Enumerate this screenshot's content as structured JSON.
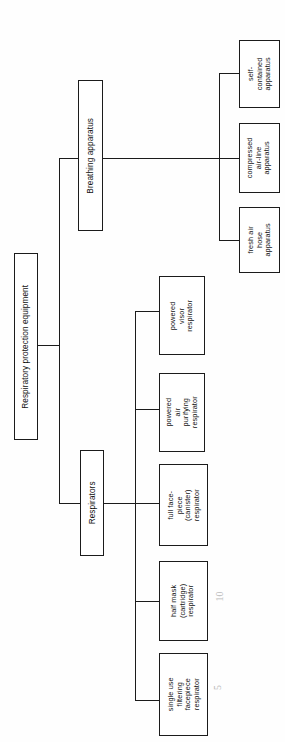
{
  "diagram": {
    "title": "Respiratory protection equipment",
    "type": "hierarchy-tree",
    "orientation": "rotated-90-ccw",
    "line_color": "#1b1b1b",
    "box_fill": "#ffffff",
    "background": "#ffffff"
  },
  "nodes": {
    "root": {
      "label": "Respiratory protection equipment",
      "level": 0
    },
    "breathing_apparatus": {
      "label": "Breathing apparatus",
      "level": 1
    },
    "respirators": {
      "label": "Respirators",
      "level": 1
    },
    "self_contained": {
      "label": "self-\ncontained\napparatus",
      "level": 2
    },
    "compressed_airline": {
      "label": "compressed\nair-line\napparatus",
      "level": 2
    },
    "fresh_air_hose": {
      "label": "fresh air\nhose\napparatus",
      "level": 2
    },
    "powered_visor": {
      "label": "powered\nvisor\nrespirator",
      "level": 2
    },
    "powered_air_purifying": {
      "label": "powered\nair\npurifying\nrespirator",
      "level": 2
    },
    "full_facepiece": {
      "label": "full face-\npiece\n(canister)\nrespirator",
      "level": 2
    },
    "half_mask": {
      "label": "half mask\n(cartridge)\nrespirator",
      "level": 2
    },
    "single_use": {
      "label": "single use\nfiltering\nfacepiece\nrespirator",
      "level": 2
    }
  },
  "annotations": {
    "mark_ten": "10",
    "mark_five": "5"
  }
}
